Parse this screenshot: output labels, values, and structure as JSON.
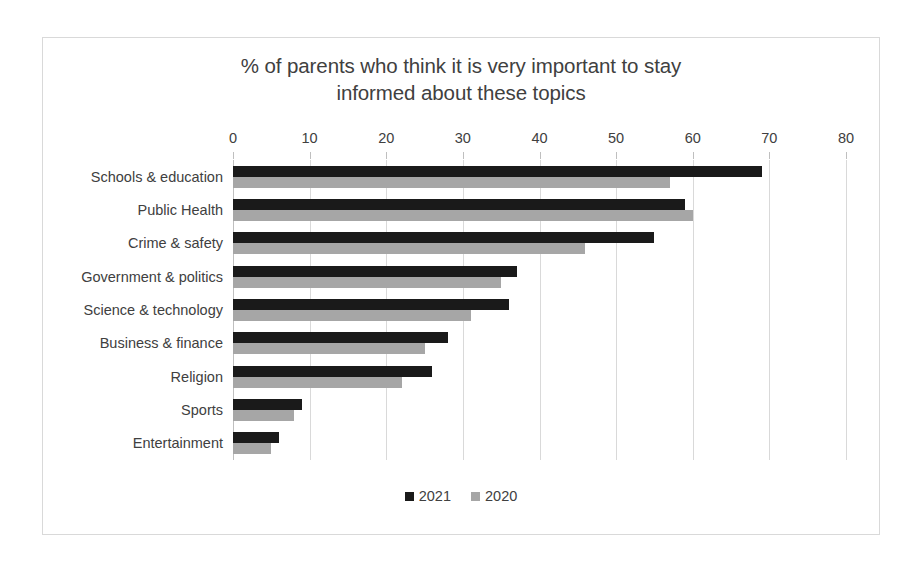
{
  "chart_data": {
    "type": "bar",
    "orientation": "horizontal",
    "title": "% of parents who think it is very important to stay informed about these topics",
    "title_lines": [
      "% of parents who think it is very important to stay",
      "informed about these topics"
    ],
    "xlabel": "",
    "ylabel": "",
    "xlim": [
      0,
      80
    ],
    "xticks": [
      0,
      10,
      20,
      30,
      40,
      50,
      60,
      70,
      80
    ],
    "xtick_labels": [
      "0",
      "10",
      "20",
      "30",
      "40",
      "50",
      "60",
      "70",
      "80"
    ],
    "grid": true,
    "grid_axis": "x",
    "legend_position": "bottom",
    "categories": [
      "Schools & education",
      "Public Health",
      "Crime & safety",
      "Government & politics",
      "Science & technology",
      "Business & finance",
      "Religion",
      "Sports",
      "Entertainment"
    ],
    "series": [
      {
        "name": "2021",
        "color": "#1a1a1a",
        "values": [
          69,
          59,
          55,
          37,
          36,
          28,
          26,
          9,
          6
        ]
      },
      {
        "name": "2020",
        "color": "#a6a6a6",
        "values": [
          57,
          60,
          46,
          35,
          31,
          25,
          22,
          8,
          5
        ]
      }
    ]
  },
  "legend": {
    "items": [
      {
        "label": "2021",
        "color": "#1a1a1a"
      },
      {
        "label": "2020",
        "color": "#a6a6a6"
      }
    ]
  }
}
